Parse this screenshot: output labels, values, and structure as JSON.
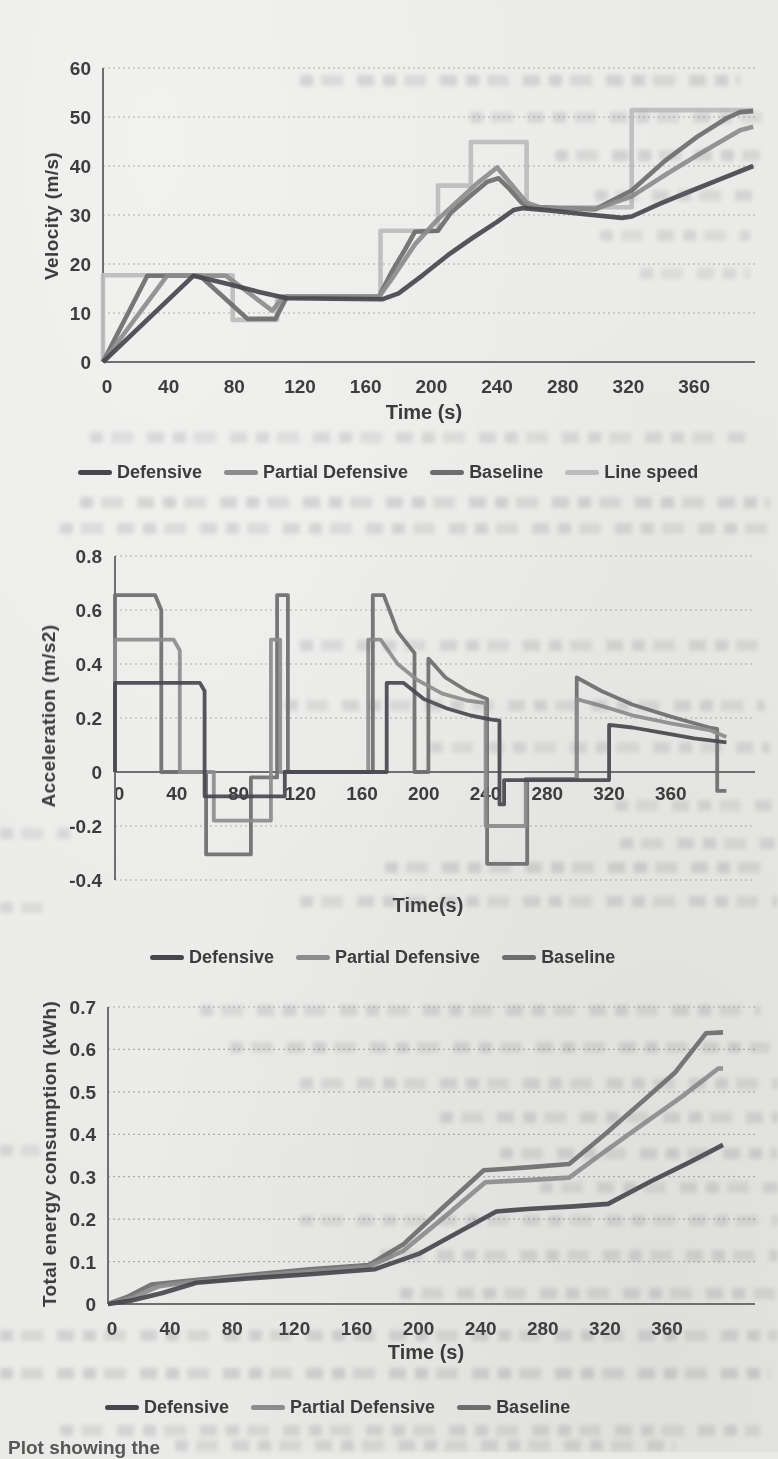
{
  "caption_fragment": "Plot showing the",
  "chart_data": [
    {
      "id": "velocity",
      "type": "line",
      "ylabel": "Velocity (m/s)",
      "xlabel": "Time (s)",
      "ylim": [
        0,
        60
      ],
      "xlim": [
        0,
        396
      ],
      "yticks": [
        0,
        10,
        20,
        30,
        40,
        50,
        60
      ],
      "xticks": [
        0,
        40,
        80,
        120,
        160,
        200,
        240,
        280,
        320,
        360
      ],
      "grid": true,
      "legend_position": "bottom",
      "series": [
        {
          "name": "Defensive",
          "color": "#46464e",
          "points": [
            [
              0,
              0
            ],
            [
              55,
              17.6
            ],
            [
              75,
              16
            ],
            [
              95,
              14.3
            ],
            [
              112,
              13
            ],
            [
              170,
              12.8
            ],
            [
              180,
              14
            ],
            [
              195,
              17.8
            ],
            [
              210,
              21.8
            ],
            [
              225,
              25.3
            ],
            [
              240,
              28.6
            ],
            [
              250,
              31
            ],
            [
              256,
              31.4
            ],
            [
              270,
              31
            ],
            [
              295,
              30.1
            ],
            [
              316,
              29.4
            ],
            [
              322,
              29.7
            ],
            [
              340,
              32.4
            ],
            [
              358,
              34.9
            ],
            [
              376,
              37.3
            ],
            [
              396,
              40
            ]
          ]
        },
        {
          "name": "Partial Defensive",
          "color": "#8c8c8c",
          "points": [
            [
              0,
              0
            ],
            [
              39,
              17.6
            ],
            [
              75,
              17.6
            ],
            [
              90,
              13.8
            ],
            [
              103,
              10.5
            ],
            [
              110,
              13.3
            ],
            [
              168,
              13.3
            ],
            [
              177,
              17.5
            ],
            [
              190,
              24
            ],
            [
              203,
              28.8
            ],
            [
              215,
              32.5
            ],
            [
              228,
              36.5
            ],
            [
              240,
              39.7
            ],
            [
              248,
              36.5
            ],
            [
              258,
              32.5
            ],
            [
              266,
              31.6
            ],
            [
              285,
              31.3
            ],
            [
              300,
              31.2
            ],
            [
              322,
              33.8
            ],
            [
              344,
              38.5
            ],
            [
              366,
              43
            ],
            [
              388,
              47.3
            ],
            [
              396,
              48
            ]
          ]
        },
        {
          "name": "Baseline",
          "color": "#6d6d6d",
          "points": [
            [
              0,
              0
            ],
            [
              27,
              17.6
            ],
            [
              59,
              17.6
            ],
            [
              88,
              8.8
            ],
            [
              105,
              8.8
            ],
            [
              112,
              13.3
            ],
            [
              168,
              13.3
            ],
            [
              176,
              18.5
            ],
            [
              184,
              23
            ],
            [
              190,
              26.6
            ],
            [
              204,
              26.8
            ],
            [
              212,
              30.5
            ],
            [
              224,
              34
            ],
            [
              234,
              36.8
            ],
            [
              241,
              37.5
            ],
            [
              247,
              35.5
            ],
            [
              255,
              32.5
            ],
            [
              260,
              31.7
            ],
            [
              275,
              31.4
            ],
            [
              300,
              31.2
            ],
            [
              322,
              35
            ],
            [
              342,
              41
            ],
            [
              362,
              46
            ],
            [
              380,
              49.8
            ],
            [
              388,
              51
            ],
            [
              396,
              51.2
            ]
          ]
        },
        {
          "name": "Line speed",
          "color": "#bcbcbc",
          "points": [
            [
              0,
              0
            ],
            [
              0,
              17.7
            ],
            [
              79,
              17.7
            ],
            [
              79,
              8.6
            ],
            [
              106,
              8.6
            ],
            [
              106,
              13.4
            ],
            [
              169,
              13.4
            ],
            [
              169,
              26.8
            ],
            [
              204,
              26.8
            ],
            [
              204,
              36
            ],
            [
              224,
              36
            ],
            [
              224,
              44.9
            ],
            [
              258,
              44.9
            ],
            [
              258,
              31.6
            ],
            [
              322,
              31.6
            ],
            [
              322,
              51.4
            ],
            [
              396,
              51.4
            ]
          ]
        }
      ]
    },
    {
      "id": "acceleration",
      "type": "line",
      "ylabel": "Acceleration (m/s2)",
      "xlabel": "Time(s)",
      "ylim": [
        -0.4,
        0.8
      ],
      "xlim": [
        0,
        396
      ],
      "yticks": [
        -0.4,
        -0.2,
        0,
        0.2,
        0.4,
        0.6,
        0.8
      ],
      "xticks": [
        0,
        40,
        80,
        120,
        160,
        200,
        240,
        280,
        320,
        360
      ],
      "grid": true,
      "legend_position": "bottom",
      "series": [
        {
          "name": "Defensive",
          "color": "#46464e",
          "points": [
            [
              0,
              0
            ],
            [
              0,
              0.33
            ],
            [
              55,
              0.33
            ],
            [
              58,
              0.3
            ],
            [
              58,
              -0.09
            ],
            [
              110,
              -0.09
            ],
            [
              110,
              0
            ],
            [
              176,
              0
            ],
            [
              176,
              0.33
            ],
            [
              187,
              0.33
            ],
            [
              200,
              0.27
            ],
            [
              215,
              0.235
            ],
            [
              230,
              0.21
            ],
            [
              243,
              0.195
            ],
            [
              249,
              0.19
            ],
            [
              249,
              -0.12
            ],
            [
              252,
              -0.12
            ],
            [
              252,
              -0.03
            ],
            [
              320,
              -0.03
            ],
            [
              320,
              0.175
            ],
            [
              335,
              0.165
            ],
            [
              355,
              0.145
            ],
            [
              375,
              0.125
            ],
            [
              396,
              0.11
            ]
          ]
        },
        {
          "name": "Partial Defensive",
          "color": "#8c8c8c",
          "points": [
            [
              0,
              0
            ],
            [
              0,
              0.49
            ],
            [
              38,
              0.49
            ],
            [
              42,
              0.45
            ],
            [
              42,
              0
            ],
            [
              64,
              0
            ],
            [
              64,
              -0.18
            ],
            [
              101,
              -0.18
            ],
            [
              101,
              0.49
            ],
            [
              107,
              0.49
            ],
            [
              107,
              0
            ],
            [
              164,
              0
            ],
            [
              164,
              0.49
            ],
            [
              172,
              0.49
            ],
            [
              183,
              0.4
            ],
            [
              196,
              0.34
            ],
            [
              212,
              0.29
            ],
            [
              228,
              0.265
            ],
            [
              240,
              0.255
            ],
            [
              240,
              -0.2
            ],
            [
              266,
              -0.2
            ],
            [
              266,
              -0.025
            ],
            [
              299,
              -0.025
            ],
            [
              299,
              0.27
            ],
            [
              315,
              0.245
            ],
            [
              335,
              0.21
            ],
            [
              360,
              0.18
            ],
            [
              385,
              0.155
            ],
            [
              396,
              0.13
            ]
          ]
        },
        {
          "name": "Baseline",
          "color": "#6d6d6d",
          "points": [
            [
              0,
              0
            ],
            [
              0,
              0.655
            ],
            [
              26,
              0.655
            ],
            [
              30,
              0.6
            ],
            [
              30,
              0
            ],
            [
              59,
              0
            ],
            [
              59,
              -0.305
            ],
            [
              88,
              -0.305
            ],
            [
              88,
              -0.02
            ],
            [
              105,
              -0.02
            ],
            [
              105,
              0.655
            ],
            [
              112,
              0.655
            ],
            [
              112,
              0
            ],
            [
              167,
              0
            ],
            [
              167,
              0.655
            ],
            [
              174,
              0.655
            ],
            [
              183,
              0.52
            ],
            [
              194,
              0.44
            ],
            [
              194,
              0
            ],
            [
              203,
              0
            ],
            [
              203,
              0.42
            ],
            [
              214,
              0.35
            ],
            [
              228,
              0.3
            ],
            [
              241,
              0.27
            ],
            [
              241,
              -0.34
            ],
            [
              267,
              -0.34
            ],
            [
              267,
              -0.025
            ],
            [
              299,
              -0.025
            ],
            [
              299,
              0.35
            ],
            [
              315,
              0.3
            ],
            [
              335,
              0.25
            ],
            [
              360,
              0.205
            ],
            [
              385,
              0.165
            ],
            [
              390,
              0.16
            ],
            [
              390,
              -0.07
            ],
            [
              396,
              -0.07
            ]
          ]
        }
      ]
    },
    {
      "id": "energy",
      "type": "line",
      "ylabel": "Total energy consumption (kWh)",
      "xlabel": "Time (s)",
      "ylim": [
        0,
        0.7
      ],
      "xlim": [
        0,
        396
      ],
      "yticks": [
        0,
        0.1,
        0.2,
        0.3,
        0.4,
        0.5,
        0.6,
        0.7
      ],
      "xticks": [
        0,
        40,
        80,
        120,
        160,
        200,
        240,
        280,
        320,
        360
      ],
      "grid": true,
      "legend_position": "bottom",
      "series": [
        {
          "name": "Defensive",
          "color": "#46464e",
          "points": [
            [
              0,
              0
            ],
            [
              15,
              0.008
            ],
            [
              35,
              0.026
            ],
            [
              57,
              0.05
            ],
            [
              90,
              0.06
            ],
            [
              130,
              0.07
            ],
            [
              172,
              0.082
            ],
            [
              200,
              0.118
            ],
            [
              230,
              0.178
            ],
            [
              250,
              0.218
            ],
            [
              270,
              0.224
            ],
            [
              300,
              0.23
            ],
            [
              322,
              0.236
            ],
            [
              350,
              0.29
            ],
            [
              375,
              0.335
            ],
            [
              396,
              0.375
            ]
          ]
        },
        {
          "name": "Partial Defensive",
          "color": "#8c8c8c",
          "points": [
            [
              0,
              0
            ],
            [
              15,
              0.014
            ],
            [
              33,
              0.042
            ],
            [
              50,
              0.05
            ],
            [
              90,
              0.064
            ],
            [
              130,
              0.077
            ],
            [
              168,
              0.088
            ],
            [
              190,
              0.125
            ],
            [
              215,
              0.2
            ],
            [
              243,
              0.287
            ],
            [
              270,
              0.292
            ],
            [
              297,
              0.298
            ],
            [
              320,
              0.36
            ],
            [
              345,
              0.425
            ],
            [
              370,
              0.49
            ],
            [
              393,
              0.555
            ],
            [
              396,
              0.555
            ]
          ]
        },
        {
          "name": "Baseline",
          "color": "#6d6d6d",
          "points": [
            [
              0,
              0
            ],
            [
              12,
              0.016
            ],
            [
              28,
              0.046
            ],
            [
              50,
              0.054
            ],
            [
              90,
              0.068
            ],
            [
              130,
              0.082
            ],
            [
              168,
              0.092
            ],
            [
              190,
              0.14
            ],
            [
              215,
              0.225
            ],
            [
              242,
              0.315
            ],
            [
              270,
              0.322
            ],
            [
              297,
              0.33
            ],
            [
              320,
              0.4
            ],
            [
              345,
              0.48
            ],
            [
              365,
              0.545
            ],
            [
              385,
              0.638
            ],
            [
              396,
              0.64
            ]
          ]
        }
      ]
    }
  ]
}
